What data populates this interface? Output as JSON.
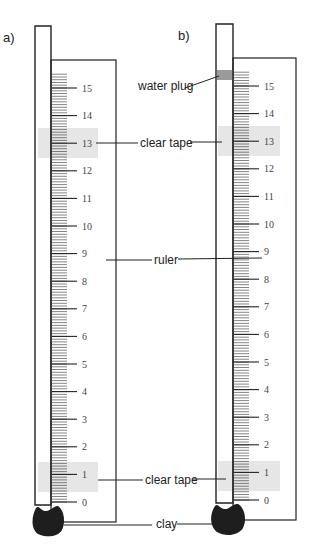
{
  "figure": {
    "panels": [
      {
        "id": "a",
        "label": "a)"
      },
      {
        "id": "b",
        "label": "b)"
      }
    ],
    "ruler_numbers": [
      "0",
      "1",
      "2",
      "3",
      "4",
      "5",
      "6",
      "7",
      "8",
      "9",
      "10",
      "11",
      "12",
      "13",
      "14",
      "15"
    ],
    "callouts": {
      "water_plug": "water plug",
      "clear_tape_top": "clear tape",
      "ruler": "ruler",
      "clear_tape_bottom": "clear tape",
      "clay": "clay"
    },
    "colors": {
      "tape": "#e6e6e6",
      "water_plug": "#9a9a9a",
      "clay": "#1e1e1e",
      "line": "#222222"
    }
  }
}
